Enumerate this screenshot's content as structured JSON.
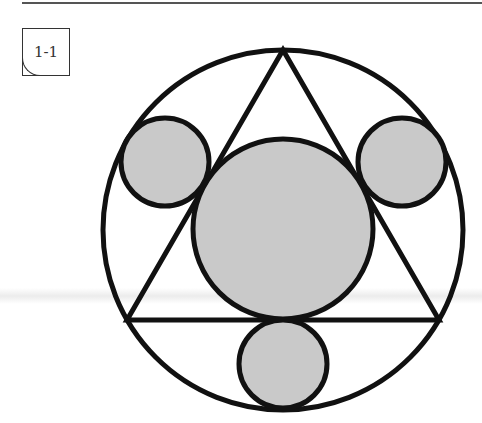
{
  "figure": {
    "label": "1-1",
    "colors": {
      "stroke": "#111111",
      "fill": "#c9c9c9",
      "background": "#ffffff"
    },
    "outer_circle": {
      "cx": 283,
      "cy": 230,
      "r": 180
    },
    "triangle": {
      "points": "283,50 127,320 439,320"
    },
    "center_circle": {
      "cx": 283,
      "cy": 229,
      "r": 90
    },
    "small_circles": [
      {
        "name": "left",
        "cx": 165,
        "cy": 162,
        "r": 44
      },
      {
        "name": "right",
        "cx": 402,
        "cy": 162,
        "r": 44
      },
      {
        "name": "bottom",
        "cx": 283,
        "cy": 364,
        "r": 44
      }
    ]
  }
}
